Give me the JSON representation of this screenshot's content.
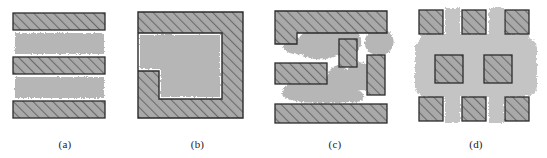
{
  "figure": {
    "title": "",
    "width": 547,
    "height": 158,
    "background_color": "#ffffff",
    "panel_count": 4
  },
  "colors": {
    "hatch_fill": "#a9a9a9",
    "hatch_line": "#6b6b6b",
    "region_gray": "#b6b6b6",
    "outline": "#2b2b2b",
    "label_text": "#1a1a1a",
    "background": "#ffffff"
  },
  "panels": [
    {
      "id": "a",
      "label": "(a)",
      "description": "horizontal-stripes",
      "hatched_bars": [
        {
          "x": 13,
          "y": 13,
          "w": 92,
          "h": 17
        },
        {
          "x": 13,
          "y": 57,
          "w": 92,
          "h": 17
        },
        {
          "x": 13,
          "y": 101,
          "w": 92,
          "h": 17
        }
      ],
      "gray_regions": [
        {
          "x": 15,
          "y": 33,
          "w": 89,
          "h": 21
        },
        {
          "x": 15,
          "y": 77,
          "w": 89,
          "h": 21
        }
      ]
    },
    {
      "id": "b",
      "label": "(b)",
      "description": "square-with-notched-inner-region",
      "hatched_bars": [
        {
          "x": 8,
          "y": 12,
          "w": 105,
          "h": 106
        }
      ],
      "gray_regions": [
        {
          "x": 9,
          "y": 33,
          "w": 83,
          "h": 66
        }
      ],
      "notch": {
        "x": 9,
        "y": 71,
        "w": 20,
        "h": 28
      }
    },
    {
      "id": "c",
      "label": "(c)",
      "description": "irregular-blobs-with-rectangular-bars",
      "hatched_bars": [
        {
          "x": 10,
          "y": 11,
          "w": 112,
          "h": 22
        },
        {
          "x": 10,
          "y": 11,
          "w": 22,
          "h": 33
        },
        {
          "x": 10,
          "y": 63,
          "w": 52,
          "h": 21
        },
        {
          "x": 74,
          "y": 39,
          "w": 18,
          "h": 28
        },
        {
          "x": 102,
          "y": 55,
          "w": 18,
          "h": 40
        },
        {
          "x": 10,
          "y": 104,
          "w": 112,
          "h": 19
        }
      ],
      "gray_regions": 4
    },
    {
      "id": "d",
      "label": "(d)",
      "description": "blob-with-eight-hatched-squares",
      "hatched_bars": [
        {
          "x": 14,
          "y": 10,
          "w": 24,
          "h": 24
        },
        {
          "x": 57,
          "y": 10,
          "w": 24,
          "h": 24
        },
        {
          "x": 100,
          "y": 10,
          "w": 24,
          "h": 24
        },
        {
          "x": 30,
          "y": 55,
          "w": 28,
          "h": 28
        },
        {
          "x": 79,
          "y": 55,
          "w": 28,
          "h": 28
        },
        {
          "x": 14,
          "y": 97,
          "w": 24,
          "h": 24
        },
        {
          "x": 57,
          "y": 97,
          "w": 24,
          "h": 24
        },
        {
          "x": 100,
          "y": 97,
          "w": 24,
          "h": 24
        }
      ],
      "gray_regions": 1
    }
  ]
}
